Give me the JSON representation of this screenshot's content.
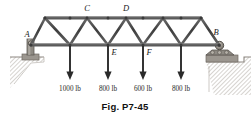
{
  "figure": {
    "caption": "Fig. P7-45",
    "colors": {
      "member": "#4a4a4a",
      "member_dark": "#2e2e2e",
      "chord": "#555555",
      "arrow": "#2a2a2a",
      "ground": "#b9b4ad",
      "pedestal": "#9e9a94",
      "text": "#1a1a1a"
    }
  },
  "joints": {
    "A": "A",
    "B": "B",
    "C": "C",
    "D": "D",
    "E": "E",
    "F": "F"
  },
  "supports": {
    "left": {
      "name": "A",
      "type": "pin"
    },
    "right": {
      "name": "B",
      "type": "roller"
    }
  },
  "loads": [
    {
      "label": "1000 lb",
      "magnitude": 1000,
      "unit": "lb",
      "x": 70
    },
    {
      "label": "800 lb",
      "magnitude": 800,
      "unit": "lb",
      "x": 108
    },
    {
      "label": "600 lb",
      "magnitude": 600,
      "unit": "lb",
      "x": 143
    },
    {
      "label": "800 lb",
      "magnitude": 800,
      "unit": "lb",
      "x": 181
    }
  ]
}
